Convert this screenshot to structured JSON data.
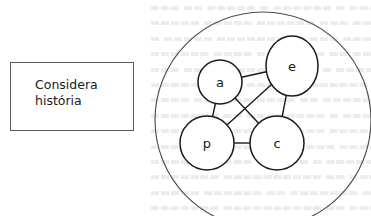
{
  "diagram": {
    "label_box": {
      "lines": [
        "Considera",
        "história"
      ]
    },
    "outer_circle": {
      "cx": 263,
      "cy": 120,
      "rx": 108,
      "ry": 108
    },
    "nodes": [
      {
        "id": "a",
        "label": "a",
        "cx": 220,
        "cy": 82,
        "rx": 22,
        "ry": 22
      },
      {
        "id": "e",
        "label": "e",
        "cx": 292,
        "cy": 66,
        "rx": 26,
        "ry": 30
      },
      {
        "id": "p",
        "label": "p",
        "cx": 207,
        "cy": 143,
        "rx": 27,
        "ry": 27
      },
      {
        "id": "c",
        "label": "c",
        "cx": 277,
        "cy": 143,
        "rx": 27,
        "ry": 27
      }
    ],
    "edges": [
      {
        "from": "a",
        "to": "e"
      },
      {
        "from": "a",
        "to": "p"
      },
      {
        "from": "a",
        "to": "c"
      },
      {
        "from": "e",
        "to": "p"
      },
      {
        "from": "e",
        "to": "c"
      },
      {
        "from": "p",
        "to": "c"
      }
    ],
    "colors": {
      "stroke": "#1a1a1a",
      "outer_stroke": "#4a4a4a",
      "box_stroke": "#5a5a5a",
      "background": "#ffffff",
      "bleed_text": "#ececec"
    }
  }
}
